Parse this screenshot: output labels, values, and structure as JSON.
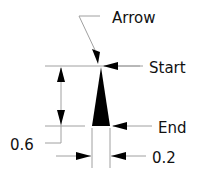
{
  "diagram": {
    "labels": {
      "arrow": "Arrow",
      "start": "Start",
      "end": "End",
      "height_dim": "0.6",
      "width_dim": "0.2"
    },
    "colors": {
      "line": "#9a9a9a",
      "shape": "#000000",
      "text": "#111111"
    }
  }
}
